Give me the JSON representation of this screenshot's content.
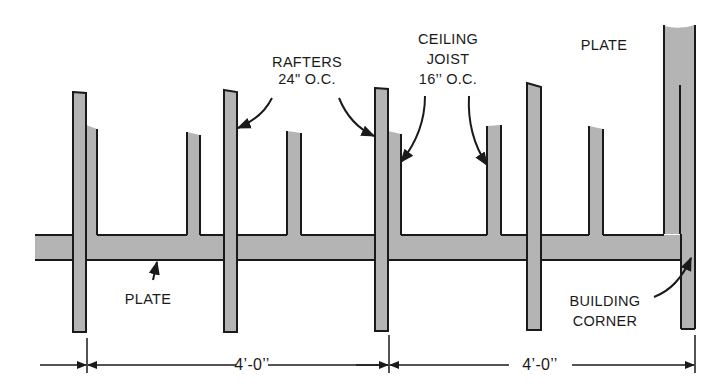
{
  "diagram": {
    "colors": {
      "wood": "#b4b4b4",
      "outline": "#1a1a1a",
      "background": "#ffffff"
    },
    "labels": {
      "rafters": {
        "line1": "RAFTERS",
        "line2": "24\" O.C."
      },
      "ceiling_joist": {
        "line1": "CEILING",
        "line2": "JOIST",
        "line3": "16’’ O.C."
      },
      "plate_top": "PLATE",
      "plate_bottom": "PLATE",
      "building_corner": {
        "line1": "BUILDING",
        "line2": "CORNER"
      }
    },
    "dimensions": [
      {
        "label": "4’-0’’"
      },
      {
        "label": "4’-0’’"
      }
    ],
    "rafters": [
      {
        "x": 73,
        "top": 92
      },
      {
        "x": 224,
        "top": 90
      },
      {
        "x": 375,
        "top": 88
      },
      {
        "x": 527,
        "top": 83
      }
    ],
    "joists": [
      {
        "x": 86,
        "top": 125
      },
      {
        "x": 187,
        "top": 132
      },
      {
        "x": 287,
        "top": 131
      },
      {
        "x": 388,
        "top": 131
      },
      {
        "x": 487,
        "top": 126
      },
      {
        "x": 589,
        "top": 126
      }
    ]
  }
}
